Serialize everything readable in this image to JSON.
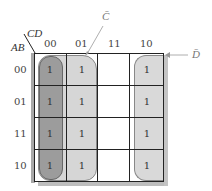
{
  "diagram": {
    "type": "karnaugh-map",
    "row_variable_label": "AB",
    "col_variable_label": "CD",
    "col_headers": [
      "00",
      "01",
      "11",
      "10"
    ],
    "row_headers": [
      "00",
      "01",
      "11",
      "10"
    ],
    "cells": [
      [
        "1",
        "1",
        "",
        "1"
      ],
      [
        "1",
        "1",
        "",
        "1"
      ],
      [
        "1",
        "1",
        "",
        "1"
      ],
      [
        "1",
        "1",
        "",
        "1"
      ]
    ],
    "groups": [
      {
        "label": "",
        "columns": [
          "00"
        ],
        "shade": "#9a9a9a"
      },
      {
        "label": "C̄",
        "columns": [
          "00",
          "01"
        ],
        "shade": "#d4d4d4"
      },
      {
        "label": "D̄",
        "columns": [
          "00",
          "10"
        ],
        "shade": "#d9d9d9"
      }
    ],
    "annotations": {
      "c_bar": "C̄",
      "d_bar": "D̄"
    },
    "colors": {
      "dark_group": "#9a9a9a",
      "light_group": "#d4d4d4",
      "shadow": "#b8b8b8",
      "grid": "#222222"
    }
  }
}
